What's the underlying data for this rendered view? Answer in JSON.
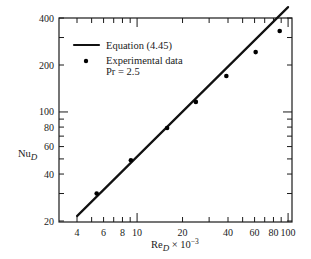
{
  "chart_data": {
    "type": "line",
    "title": "",
    "xlabel": "Re_D × 10^-3",
    "ylabel": "Nu_D",
    "xscale": "log",
    "yscale": "log",
    "xlim": [
      3.2,
      105
    ],
    "ylim": [
      20,
      520
    ],
    "grid": false,
    "legend_position": "upper left (inside)",
    "x_ticks_major": [
      4,
      6,
      8,
      10,
      20,
      40,
      60,
      80,
      100
    ],
    "x_ticks_minor": [
      5,
      7,
      9,
      30,
      50,
      70,
      90
    ],
    "y_ticks_major": [
      20,
      40,
      60,
      80,
      100,
      200,
      400
    ],
    "y_ticks_minor": [
      30,
      50,
      70,
      90,
      300
    ],
    "legend": [
      {
        "label": "Equation (4.45)",
        "marker": "line"
      },
      {
        "label": "Experimental data",
        "sublabel": "Pr = 2.5",
        "marker": "dot"
      }
    ],
    "series": [
      {
        "name": "Equation (4.45)",
        "kind": "line",
        "x": [
          4,
          100
        ],
        "y": [
          21.5,
          470
        ]
      },
      {
        "name": "Experimental data (Pr = 2.5)",
        "kind": "scatter",
        "x": [
          5.4,
          9.1,
          15.8,
          24.5,
          39,
          61,
          88
        ],
        "y": [
          30,
          49,
          79,
          116,
          170,
          242,
          330
        ]
      }
    ]
  },
  "labels": {
    "y_axis": "Nu",
    "y_axis_sub": "D",
    "x_axis_main": "Re",
    "x_axis_sub": "D",
    "x_axis_suffix": " × 10",
    "x_axis_exp": "−3",
    "legend_line": "Equation (4.45)",
    "legend_dot_line1": "Experimental data",
    "legend_dot_line2": "Pr = 2.5"
  }
}
